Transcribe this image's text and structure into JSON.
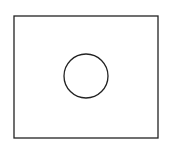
{
  "diagram": {
    "background": "#ffffff",
    "stroke_color": "#222222",
    "shapes": [
      {
        "type": "rectangle",
        "x": 14,
        "y": 16,
        "width": 144,
        "height": 122
      },
      {
        "type": "circle",
        "cx": 86,
        "cy": 76,
        "r": 22
      }
    ]
  }
}
